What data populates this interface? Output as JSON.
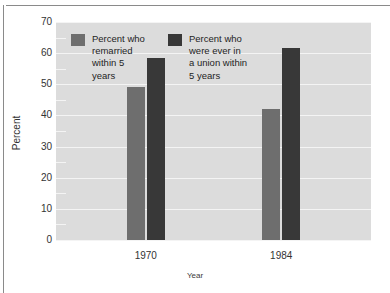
{
  "chart_data": {
    "type": "bar",
    "title": "",
    "subtitle": "",
    "xlabel": "Year",
    "ylabel": "Percent",
    "categories": [
      "1970",
      "1984"
    ],
    "series": [
      {
        "name": "Percent who remarried within 5 years",
        "legend_label": "Percent who\nremarried\nwithin 5\nyears",
        "color": "#6e6e6e",
        "values": [
          49,
          42
        ]
      },
      {
        "name": "Percent who were ever in a union within 5 years",
        "legend_label": "Percent who\nwere ever in\na union within\n5 years",
        "color": "#383838",
        "values": [
          58.5,
          61.5
        ]
      }
    ],
    "ylim": [
      0,
      70
    ],
    "yticks": [
      0,
      10,
      20,
      30,
      40,
      50,
      60,
      70
    ],
    "ytick_labels": [
      "0",
      "10",
      "20",
      "30",
      "40",
      "50",
      "60",
      "70"
    ],
    "minor_yticks": [
      5,
      15,
      25,
      35,
      45,
      55,
      65
    ],
    "grid": true,
    "grid_color": "#f4f4f4",
    "plot_background": "#dcdcdc",
    "legend_position": "upper-left-inside"
  }
}
